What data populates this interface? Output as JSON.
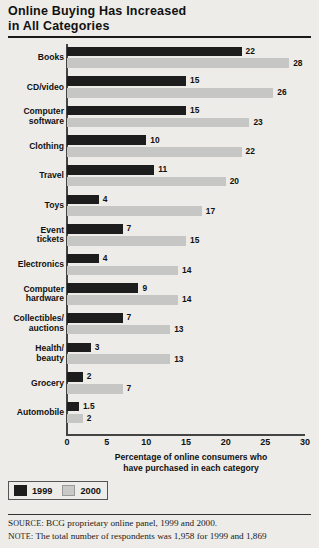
{
  "title": {
    "line1": "Online Buying Has Increased",
    "line2": "in All Categories"
  },
  "legend": {
    "items": [
      {
        "label": "1999",
        "color": "#1d1d1d",
        "key": "y1999"
      },
      {
        "label": "2000",
        "color": "#c9c9c7",
        "key": "y2000"
      }
    ]
  },
  "footer": {
    "source_prefix": "S",
    "source_small": "OURCE",
    "source_text": ": BCG proprietary online panel, 1999 and 2000.",
    "note_prefix": "N",
    "note_small": "OTE",
    "note_text": ": The total number of respondents was 1,958 for 1999 and 1,869"
  },
  "chart_data": {
    "type": "bar",
    "orientation": "horizontal",
    "title": "Online Buying Has Increased in All Categories",
    "xlabel": "Percentage of online consumers who have purchased in each category",
    "ylabel": "",
    "xlim": [
      0,
      30
    ],
    "xticks": [
      0,
      5,
      10,
      15,
      20,
      25,
      30
    ],
    "xticklabels": [
      "0",
      "5",
      "10",
      "15",
      "20",
      "25",
      "30"
    ],
    "grid": false,
    "legend_position": "bottom-left",
    "categories": [
      "Books",
      "CD/video",
      "Computer\nsoftware",
      "Clothing",
      "Travel",
      "Toys",
      "Event\ntickets",
      "Electronics",
      "Computer\nhardware",
      "Collectibles/\nauctions",
      "Health/\nbeauty",
      "Grocery",
      "Automobile"
    ],
    "series": [
      {
        "name": "1999",
        "color": "#1d1d1d",
        "values": [
          22,
          15,
          15,
          10,
          11,
          4,
          7,
          4,
          9,
          7,
          3,
          2,
          1.5
        ],
        "labels": [
          "22",
          "15",
          "15",
          "10",
          "11",
          "4",
          "7",
          "4",
          "9",
          "7",
          "3",
          "2",
          "1.5"
        ]
      },
      {
        "name": "2000",
        "color": "#c6c6c4",
        "values": [
          28,
          26,
          23,
          22,
          20,
          17,
          15,
          14,
          14,
          13,
          13,
          7,
          2
        ],
        "labels": [
          "28",
          "26",
          "23",
          "22",
          "20",
          "17",
          "15",
          "14",
          "14",
          "13",
          "13",
          "7",
          "2"
        ]
      }
    ]
  }
}
